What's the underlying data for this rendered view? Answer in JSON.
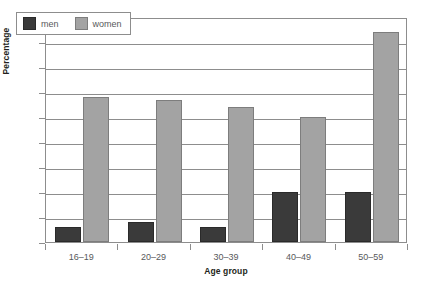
{
  "chart_data": {
    "type": "bar",
    "title": "",
    "subtitle": "",
    "xlabel": "Age group",
    "ylabel": "Percentage",
    "categories": [
      "16–19",
      "20–29",
      "30–39",
      "40–49",
      "50–59"
    ],
    "series": [
      {
        "name": "men",
        "color": "#3a3a3a",
        "values": [
          3,
          4,
          3,
          10,
          10
        ]
      },
      {
        "name": "women",
        "color": "#a3a3a3",
        "values": [
          29,
          28.5,
          27,
          25,
          42
        ]
      }
    ],
    "ylim": [
      0,
      45
    ],
    "ytick_step": 5,
    "yticks": [
      0,
      5,
      10,
      15,
      20,
      25,
      30,
      35,
      40,
      45
    ],
    "ytick_labels": [
      "0",
      "5",
      "10",
      "15",
      "20",
      "25",
      "30",
      "35",
      "40",
      "45"
    ],
    "grid": "horizontal",
    "legend_position": "top-left-inside",
    "legend_entries": [
      "men",
      "women"
    ],
    "annotations": []
  },
  "legend": {
    "items": [
      {
        "label": "men",
        "swatch": "men-swatch"
      },
      {
        "label": "women",
        "swatch": "women-swatch"
      }
    ]
  }
}
